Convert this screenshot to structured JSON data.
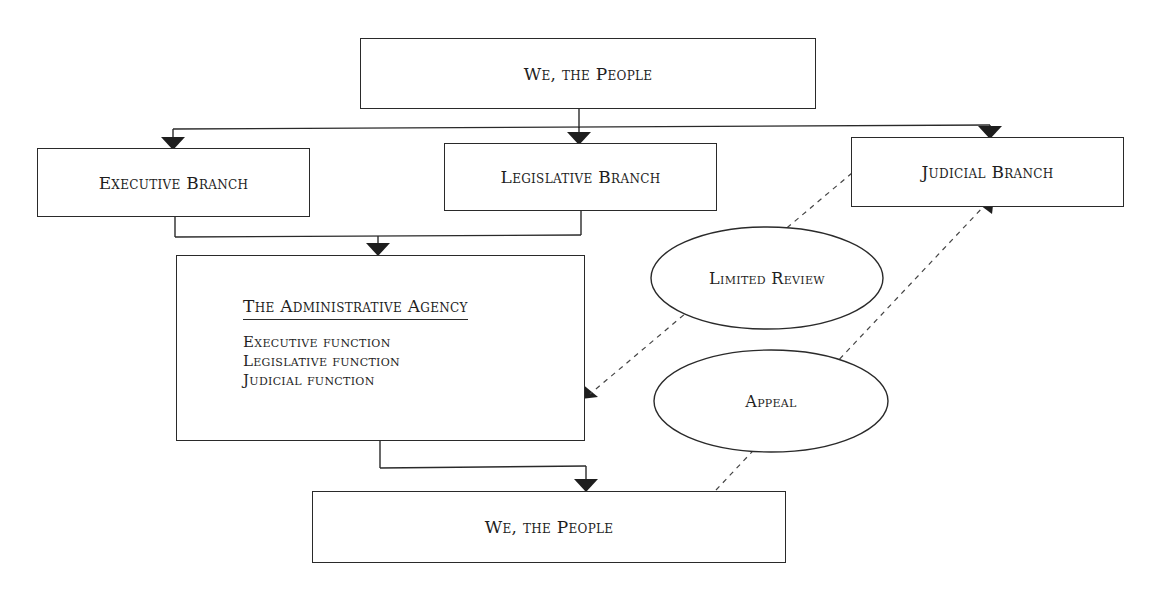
{
  "diagram": {
    "top_people": {
      "label": "We, the People"
    },
    "branches": [
      {
        "id": "executive",
        "label": "Executive Branch"
      },
      {
        "id": "legislative",
        "label": "Legislative Branch"
      },
      {
        "id": "judicial",
        "label": "Judicial Branch"
      }
    ],
    "agency": {
      "title": "The Administrative Agency",
      "functions": [
        "Executive function",
        "Legislative function",
        "Judicial function"
      ]
    },
    "ellipses": [
      {
        "id": "limited-review",
        "label": "Limited Review"
      },
      {
        "id": "appeal",
        "label": "Appeal"
      }
    ],
    "bottom_people": {
      "label": "We, the People"
    },
    "edges": [
      {
        "from": "We, the People (top)",
        "to": "Executive Branch",
        "style": "solid"
      },
      {
        "from": "We, the People (top)",
        "to": "Legislative Branch",
        "style": "solid"
      },
      {
        "from": "We, the People (top)",
        "to": "Judicial Branch",
        "style": "solid"
      },
      {
        "from": "Executive Branch",
        "to": "The Administrative Agency",
        "style": "solid"
      },
      {
        "from": "Legislative Branch",
        "to": "The Administrative Agency",
        "style": "solid"
      },
      {
        "from": "The Administrative Agency",
        "to": "We, the People (bottom)",
        "style": "solid"
      },
      {
        "from": "Judicial Branch",
        "to": "The Administrative Agency",
        "style": "dashed",
        "label": "Limited Review"
      },
      {
        "from": "We, the People (bottom)",
        "to": "Judicial Branch",
        "style": "dashed",
        "label": "Appeal"
      }
    ],
    "colors": {
      "line": "#2a2a2a",
      "text": "#1e1e1e",
      "background": "#ffffff"
    }
  }
}
